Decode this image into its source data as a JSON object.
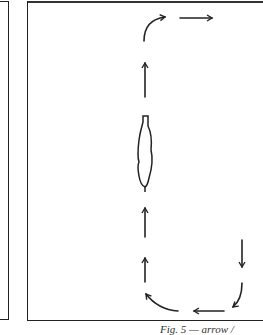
{
  "diagram": {
    "panels": [
      {
        "name": "left-arena-edge"
      },
      {
        "name": "right-arena"
      }
    ],
    "figure": {
      "label": "horse (top view)"
    },
    "arrows": [
      {
        "direction": "curve-up-right",
        "position": "top-left-corner"
      },
      {
        "direction": "right",
        "position": "top"
      },
      {
        "direction": "up",
        "position": "center-upper"
      },
      {
        "direction": "up",
        "position": "center-lower-1"
      },
      {
        "direction": "up",
        "position": "center-lower-2"
      },
      {
        "direction": "curve-left-up",
        "position": "bottom-left-corner"
      },
      {
        "direction": "left",
        "position": "bottom"
      },
      {
        "direction": "curve-down-left",
        "position": "bottom-right-corner"
      },
      {
        "direction": "down",
        "position": "right-side"
      }
    ],
    "caption": "Fig. 5 — arrow /"
  },
  "colors": {
    "stroke": "#222222",
    "background": "#ffffff"
  }
}
